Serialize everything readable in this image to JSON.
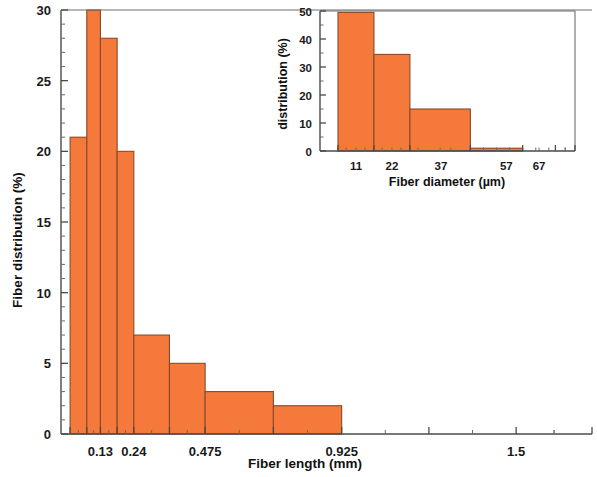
{
  "figure": {
    "background": "#ffffff",
    "bar_fill": "#F4793B",
    "bar_stroke": "#8a4a28",
    "axis_color": "#4a4a4a"
  },
  "chart_data": [
    {
      "id": "main",
      "type": "bar",
      "title": "",
      "xlabel": "Fiber length (mm)",
      "ylabel": "Fiber distribution (%)",
      "xlim": [
        0.0,
        1.75
      ],
      "ylim": [
        0,
        30
      ],
      "grid": false,
      "legend": "none",
      "xtick_labels": [
        "0.13",
        "0.24",
        "0.475",
        "0.925",
        "1.5"
      ],
      "xtick_values": [
        0.13,
        0.24,
        0.475,
        0.925,
        1.5
      ],
      "ytick_labels": [
        "0",
        "5",
        "10",
        "15",
        "20",
        "25",
        "30"
      ],
      "ytick_values": [
        0,
        5,
        10,
        15,
        20,
        25,
        30
      ],
      "yminor_step": 1,
      "bin_edges": [
        0.03,
        0.085,
        0.13,
        0.185,
        0.24,
        0.3575,
        0.475,
        0.7,
        0.925,
        1.2125,
        1.5,
        1.75
      ],
      "bars": [
        {
          "label": "0.03-0.085",
          "x_left": 0.03,
          "x_right": 0.085,
          "value": 21
        },
        {
          "label": "0.085-0.13",
          "x_left": 0.085,
          "x_right": 0.13,
          "value": 30
        },
        {
          "label": "0.13-0.185",
          "x_left": 0.13,
          "x_right": 0.185,
          "value": 28
        },
        {
          "label": "0.185-0.24",
          "x_left": 0.185,
          "x_right": 0.24,
          "value": 20
        },
        {
          "label": "0.24-0.3575",
          "x_left": 0.24,
          "x_right": 0.3575,
          "value": 7
        },
        {
          "label": "0.3575-0.475",
          "x_left": 0.3575,
          "x_right": 0.475,
          "value": 5
        },
        {
          "label": "0.475-0.7",
          "x_left": 0.475,
          "x_right": 0.7,
          "value": 3
        },
        {
          "label": "0.7-0.925",
          "x_left": 0.7,
          "x_right": 0.925,
          "value": 2
        },
        {
          "label": "0.925-1.5",
          "x_left": 0.925,
          "x_right": 1.5,
          "value": 0
        },
        {
          "label": "1.5-1.75",
          "x_left": 1.5,
          "x_right": 1.75,
          "value": 0
        }
      ],
      "values": [
        21,
        30,
        28,
        20,
        7,
        5,
        3,
        2,
        0,
        0
      ]
    },
    {
      "id": "inset",
      "type": "bar",
      "title": "",
      "xlabel": "Fiber diameter (µm)",
      "ylabel": "distribution (%)",
      "xlim": [
        0,
        78
      ],
      "ylim": [
        0,
        50
      ],
      "grid": false,
      "legend": "none",
      "xtick_labels": [
        "11",
        "22",
        "37",
        "57",
        "67"
      ],
      "xtick_values": [
        11,
        22,
        37,
        57,
        67
      ],
      "ytick_labels": [
        "0",
        "10",
        "20",
        "30",
        "40",
        "50"
      ],
      "ytick_values": [
        0,
        10,
        20,
        30,
        40,
        50
      ],
      "yminor_step": 5,
      "bin_edges": [
        5.5,
        16.5,
        27.5,
        46,
        62,
        72,
        78
      ],
      "bars": [
        {
          "label": "5.5-16.5",
          "x_left": 5.5,
          "x_right": 16.5,
          "value": 49.5
        },
        {
          "label": "16.5-27.5",
          "x_left": 16.5,
          "x_right": 27.5,
          "value": 34.5
        },
        {
          "label": "27.5-46",
          "x_left": 27.5,
          "x_right": 46,
          "value": 15
        },
        {
          "label": "46-62",
          "x_left": 46,
          "x_right": 62,
          "value": 1
        },
        {
          "label": "62-72",
          "x_left": 62,
          "x_right": 72,
          "value": 0
        },
        {
          "label": "72-78",
          "x_left": 72,
          "x_right": 78,
          "value": 0
        }
      ],
      "values": [
        49.5,
        34.5,
        15,
        1,
        0,
        0
      ]
    }
  ]
}
